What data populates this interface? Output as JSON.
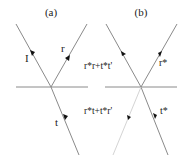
{
  "figure": {
    "panels": [
      {
        "id": "a",
        "title": "(a)",
        "interface": {
          "x1": 16,
          "y1": 87,
          "x2": 88,
          "y2": 87
        },
        "origin": {
          "x": 51,
          "y": 87
        },
        "rays": [
          {
            "name": "incident",
            "label": "I",
            "x1": 16,
            "y1": 24,
            "x2": 51,
            "y2": 87,
            "arrow": {
              "x": 32,
              "y": 53,
              "dir": "down"
            },
            "label_pos": {
              "x": 24,
              "y": 60
            },
            "faint": false
          },
          {
            "name": "reflected",
            "label": "r",
            "x1": 51,
            "y1": 87,
            "x2": 87,
            "y2": 24,
            "arrow": {
              "x": 68,
              "y": 58,
              "dir": "up"
            },
            "label_pos": {
              "x": 62,
              "y": 51
            },
            "faint": false
          },
          {
            "name": "transmitted",
            "label": "t",
            "x1": 51,
            "y1": 87,
            "x2": 79,
            "y2": 155,
            "arrow": {
              "x": 65,
              "y": 117,
              "dir": "down"
            },
            "label_pos": {
              "x": 56,
              "y": 128
            },
            "faint": false
          }
        ]
      },
      {
        "id": "b",
        "title": "(b)",
        "interface": {
          "x1": 105,
          "y1": 87,
          "x2": 177,
          "y2": 87
        },
        "origin": {
          "x": 141,
          "y": 87
        },
        "rays": [
          {
            "name": "reversed-incident",
            "label": "r*r+t*t'",
            "x1": 141,
            "y1": 87,
            "x2": 106,
            "y2": 24,
            "arrow": {
              "x": 123,
              "y": 55,
              "dir": "up"
            },
            "label_pos": {
              "x": 83,
              "y": 68
            },
            "faint": false
          },
          {
            "name": "reversed-reflected",
            "label": "r*",
            "x1": 177,
            "y1": 24,
            "x2": 141,
            "y2": 87,
            "arrow": {
              "x": 159,
              "y": 55,
              "dir": "down"
            },
            "label_pos": {
              "x": 161,
              "y": 68
            },
            "faint": false
          },
          {
            "name": "reversed-transmitted",
            "label": "t*",
            "x1": 168,
            "y1": 155,
            "x2": 141,
            "y2": 87,
            "arrow": {
              "x": 155,
              "y": 117,
              "dir": "up"
            },
            "label_pos": {
              "x": 160,
              "y": 113
            },
            "faint": false
          },
          {
            "name": "extra-transmitted",
            "label": "r*t+t*r'",
            "x1": 141,
            "y1": 87,
            "x2": 113,
            "y2": 155,
            "arrow": {
              "x": 128,
              "y": 117,
              "dir": "down"
            },
            "label_pos": {
              "x": 85,
              "y": 113
            },
            "faint": true
          }
        ]
      }
    ]
  },
  "labels": {
    "a_title": "(a)",
    "b_title": "(b)",
    "a_incident": "I",
    "a_reflected": "r",
    "a_transmitted": "t",
    "b_upper_left": "r*r+t*t'",
    "b_upper_right": "r*",
    "b_lower_left": "r*t+t*r'",
    "b_lower_right": "t*"
  },
  "colors": {
    "line": "#8a8a8a",
    "faint_line": "#d4d4d4",
    "arrow": "#111111",
    "text": "#222222",
    "background": "#ffffff"
  }
}
